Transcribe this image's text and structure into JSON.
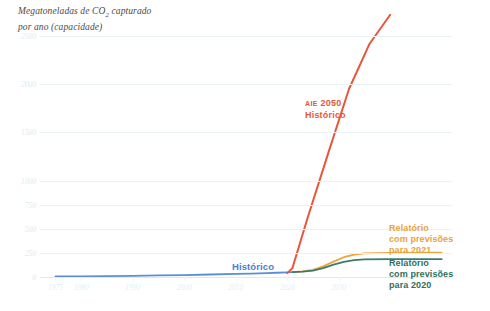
{
  "title": {
    "line1_pre": "Megatoneladas de CO",
    "line1_sub": "2",
    "line1_post": " capturado",
    "line2": "por ano (capacidade)"
  },
  "colors": {
    "historical": "#5a8fd8",
    "report_2021": "#f0a23c",
    "report_2020": "#3a7d6e",
    "iea_2050": "#e8563a",
    "gridline": "#eaf2f8",
    "tick_text": "#dcebf6"
  },
  "annotations": {
    "iea_small": "AIE",
    "iea_year": "2050",
    "iea_second": "Histórico",
    "historical": "Histórico",
    "report_2021_l1": "Relatório",
    "report_2021_l2": "com previsões",
    "report_2021_l3": "para 2021",
    "report_2020_l1": "Relatório",
    "report_2020_l2": "com previsões",
    "report_2020_l3": "para 2020"
  },
  "chart_data": {
    "type": "line",
    "title": "Megatoneladas de CO2 capturado por ano (capacidade)",
    "xlabel": "",
    "ylabel": "Megatoneladas de CO2 capturado por ano (capacidade)",
    "xlim": [
      1972,
      2052
    ],
    "ylim": [
      0,
      2500
    ],
    "grid": true,
    "legend_position": "inline-annotations",
    "yticks": [
      0,
      250,
      500,
      750,
      1000,
      1500,
      2000,
      2500
    ],
    "ytick_labels": [
      "0",
      "250",
      "500",
      "750",
      "1000",
      "1500",
      "2000",
      "2500"
    ],
    "xticks": [
      1975,
      1980,
      1990,
      2000,
      2010,
      2020,
      2030
    ],
    "xtick_labels": [
      "1975",
      "1980",
      "1990",
      "2000",
      "2010",
      "2020",
      "2030"
    ],
    "series": [
      {
        "name": "Histórico",
        "color": "#5a8fd8",
        "x": [
          1975,
          1980,
          1985,
          1990,
          1995,
          2000,
          2005,
          2010,
          2013,
          2016,
          2018,
          2020,
          2021
        ],
        "values": [
          5,
          7,
          9,
          12,
          16,
          20,
          26,
          32,
          36,
          40,
          44,
          48,
          50
        ]
      },
      {
        "name": "Relatório com previsões para 2021",
        "color": "#f0a23c",
        "x": [
          2021,
          2023,
          2025,
          2027,
          2029,
          2031,
          2033,
          2035,
          2040,
          2045,
          2050
        ],
        "values": [
          50,
          58,
          75,
          110,
          160,
          205,
          232,
          245,
          250,
          252,
          253
        ]
      },
      {
        "name": "Relatório com previsões para 2020",
        "color": "#3a7d6e",
        "x": [
          2021,
          2023,
          2025,
          2027,
          2029,
          2031,
          2033,
          2035,
          2040,
          2045,
          2050
        ],
        "values": [
          50,
          55,
          66,
          92,
          128,
          158,
          175,
          182,
          185,
          186,
          186
        ]
      },
      {
        "name": "AIE 2050 Histórico",
        "color": "#e8563a",
        "x": [
          2020,
          2021,
          2024,
          2028,
          2032,
          2036,
          2040
        ],
        "values": [
          40,
          90,
          620,
          1290,
          1950,
          2420,
          2720
        ]
      }
    ]
  }
}
